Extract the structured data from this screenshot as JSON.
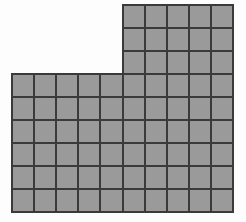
{
  "figure": {
    "name": "l-shaped-unit-square-grid",
    "background_color": "#fdfdfd",
    "cell_fill_color": "#9a9a9a",
    "grid_line_color": "#3a3a3a",
    "outer_border_color": "#3a3a3a",
    "grid_line_width": 2,
    "outer_border_width": 2
  },
  "geometry": {
    "origin_x": 12,
    "origin_y": 5,
    "cell_width": 22.1,
    "cell_height": 23.0,
    "total_columns": 10,
    "total_rows": 9,
    "left_edge": 12,
    "right_edge": 233,
    "top_edge": 5,
    "bottom_edge": 212,
    "step_corner_x": 124,
    "step_corner_y": 74
  },
  "blocks": [
    {
      "name": "upper-block",
      "columns": 5,
      "rows": 3,
      "col_start": 5,
      "row_start": 0,
      "cell_count": 15
    },
    {
      "name": "lower-block",
      "columns": 10,
      "rows": 6,
      "col_start": 0,
      "row_start": 3,
      "cell_count": 60
    }
  ],
  "chart_data": {
    "type": "table",
    "title": "",
    "shape": "L-shaped polyomino of unit squares",
    "categories": [
      "upper-block",
      "lower-block",
      "total"
    ],
    "values": [
      15,
      60,
      75
    ],
    "rows_per_column": [
      6,
      6,
      6,
      6,
      6,
      9,
      9,
      9,
      9,
      9
    ],
    "columns_per_row": [
      5,
      5,
      5,
      10,
      10,
      10,
      10,
      10,
      10
    ],
    "total_unit_squares": 75,
    "grid_columns": 10,
    "grid_rows": 9,
    "xlabel": "",
    "ylabel": ""
  }
}
